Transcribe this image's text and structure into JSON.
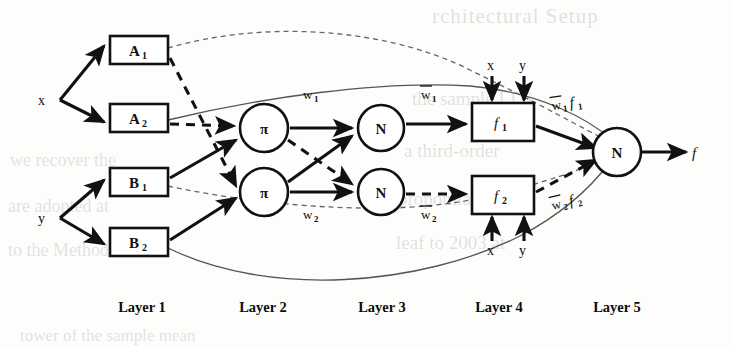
{
  "figure": {
    "type": "anfis-architecture-diagram",
    "title": "",
    "background_color": "#fdfdfc",
    "ink_color": "#111111"
  },
  "inputs": [
    {
      "id": "x",
      "label": "x",
      "x": 42,
      "y": 100
    },
    {
      "id": "y",
      "label": "y",
      "x": 42,
      "y": 218
    }
  ],
  "output": {
    "id": "f",
    "label": "f",
    "x": 694,
    "y": 153
  },
  "layer1": {
    "label": "Layer 1",
    "label_x": 142,
    "label_y": 308,
    "nodes": [
      {
        "id": "A1",
        "base": "A",
        "sub": "1",
        "x": 110,
        "y": 36,
        "w": 58,
        "h": 28
      },
      {
        "id": "A2",
        "base": "A",
        "sub": "2",
        "x": 110,
        "y": 104,
        "w": 58,
        "h": 28
      },
      {
        "id": "B1",
        "base": "B",
        "sub": "1",
        "x": 110,
        "y": 168,
        "w": 58,
        "h": 28
      },
      {
        "id": "B2",
        "base": "B",
        "sub": "2",
        "x": 110,
        "y": 228,
        "w": 58,
        "h": 28
      }
    ]
  },
  "layer2": {
    "label": "Layer 2",
    "label_x": 263,
    "label_y": 308,
    "nodes": [
      {
        "id": "pi1",
        "symbol": "π",
        "cx": 264,
        "cy": 128,
        "r": 24
      },
      {
        "id": "pi2",
        "symbol": "π",
        "cx": 264,
        "cy": 192,
        "r": 24
      }
    ],
    "edge_labels": [
      {
        "id": "w1",
        "base": "w",
        "sub": "1",
        "overbar": false,
        "x": 306,
        "y": 97
      },
      {
        "id": "w2",
        "base": "w",
        "sub": "2",
        "overbar": false,
        "x": 306,
        "y": 214
      }
    ]
  },
  "layer3": {
    "label": "Layer 3",
    "label_x": 382,
    "label_y": 308,
    "nodes": [
      {
        "id": "N1",
        "symbol": "N",
        "cx": 381,
        "cy": 128,
        "r": 23
      },
      {
        "id": "N2",
        "symbol": "N",
        "cx": 381,
        "cy": 192,
        "r": 23
      }
    ],
    "edge_labels": [
      {
        "id": "wbar1",
        "base": "w",
        "sub": "1",
        "overbar": true,
        "x": 424,
        "y": 97
      },
      {
        "id": "wbar2",
        "base": "w",
        "sub": "2",
        "overbar": true,
        "x": 424,
        "y": 214
      }
    ]
  },
  "layer4": {
    "label": "Layer 4",
    "label_x": 499,
    "label_y": 308,
    "nodes": [
      {
        "id": "f1",
        "base": "f",
        "sub": "1",
        "x": 472,
        "y": 103,
        "w": 62,
        "h": 38
      },
      {
        "id": "f2",
        "base": "f",
        "sub": "2",
        "x": 472,
        "y": 176,
        "w": 62,
        "h": 38
      }
    ],
    "feed_labels_top": [
      {
        "id": "x-top",
        "label": "x",
        "x": 491,
        "y": 68
      },
      {
        "id": "y-top",
        "label": "y",
        "x": 523,
        "y": 68
      }
    ],
    "feed_labels_bottom": [
      {
        "id": "x-bottom",
        "label": "x",
        "x": 491,
        "y": 250
      },
      {
        "id": "y-bottom",
        "label": "y",
        "x": 523,
        "y": 250
      }
    ],
    "edge_labels": [
      {
        "id": "wbar1f1",
        "base": "w",
        "sub": "1",
        "overbar": true,
        "tail": "f",
        "tail_sub": "1",
        "x": 569,
        "y": 107
      },
      {
        "id": "wbar2f2",
        "base": "w",
        "sub": "2",
        "overbar": true,
        "tail": "f",
        "tail_sub": "2",
        "x": 569,
        "y": 205
      }
    ]
  },
  "layer5": {
    "label": "Layer 5",
    "label_x": 617,
    "label_y": 308,
    "nodes": [
      {
        "id": "N3",
        "symbol": "N",
        "cx": 617,
        "cy": 152,
        "r": 24
      }
    ]
  },
  "legend_note": ""
}
